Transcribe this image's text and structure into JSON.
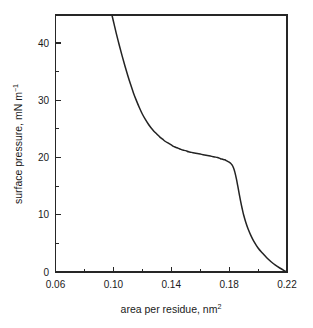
{
  "chart_data": {
    "type": "line",
    "title": "",
    "xlabel": "area per residue, nm",
    "xlabel_sup": "2",
    "ylabel": "surface pressure, mN m",
    "ylabel_sup": "−1",
    "xlim": [
      0.06,
      0.22
    ],
    "ylim": [
      0,
      44.9
    ],
    "grid": false,
    "legend": "none",
    "x_major_ticks": [
      0.06,
      0.1,
      0.14,
      0.18,
      0.22
    ],
    "x_major_tick_labels": [
      "0.06",
      "0.10",
      "0.14",
      "0.18",
      "0.22"
    ],
    "x_minor_ticks": [
      0.08,
      0.12,
      0.16,
      0.2
    ],
    "y_major_ticks": [
      0,
      10,
      20,
      30,
      40
    ],
    "y_major_tick_labels": [
      "0",
      "10",
      "20",
      "30",
      "40"
    ],
    "y_minor_ticks": [
      5,
      15,
      25,
      35
    ],
    "series": [
      {
        "name": "isotherm",
        "color": "#232323",
        "x": [
          0.099,
          0.1005,
          0.102,
          0.104,
          0.106,
          0.108,
          0.11,
          0.112,
          0.114,
          0.116,
          0.118,
          0.12,
          0.122,
          0.124,
          0.126,
          0.128,
          0.13,
          0.132,
          0.134,
          0.136,
          0.138,
          0.14,
          0.142,
          0.144,
          0.146,
          0.148,
          0.15,
          0.152,
          0.154,
          0.156,
          0.158,
          0.16,
          0.162,
          0.164,
          0.166,
          0.168,
          0.17,
          0.172,
          0.174,
          0.1755,
          0.177,
          0.1785,
          0.18,
          0.181,
          0.182,
          0.183,
          0.184,
          0.185,
          0.186,
          0.187,
          0.188,
          0.189,
          0.19,
          0.1915,
          0.193,
          0.195,
          0.197,
          0.2,
          0.203,
          0.206,
          0.209,
          0.212,
          0.215,
          0.218,
          0.22
        ],
        "y": [
          44.9,
          43.3,
          41.7,
          39.7,
          37.8,
          36.0,
          34.3,
          32.7,
          31.2,
          29.9,
          28.7,
          27.6,
          26.7,
          25.9,
          25.2,
          24.6,
          24.1,
          23.6,
          23.2,
          22.8,
          22.5,
          22.2,
          21.9,
          21.7,
          21.5,
          21.3,
          21.2,
          21.0,
          20.9,
          20.8,
          20.7,
          20.6,
          20.5,
          20.4,
          20.3,
          20.2,
          20.1,
          20.0,
          19.8,
          19.7,
          19.6,
          19.4,
          19.2,
          19.0,
          18.7,
          18.2,
          17.4,
          16.3,
          15.0,
          13.6,
          12.3,
          11.1,
          10.0,
          8.7,
          7.6,
          6.4,
          5.4,
          4.2,
          3.3,
          2.5,
          1.8,
          1.2,
          0.7,
          0.25,
          0.0
        ]
      }
    ]
  }
}
